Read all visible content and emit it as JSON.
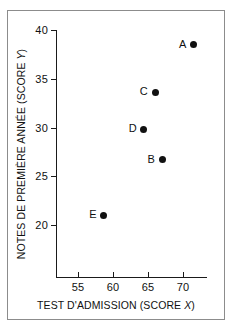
{
  "chart_data": {
    "type": "scatter",
    "title": "",
    "xlabel": "TEST D'ADMISSION (SCORE X)",
    "ylabel": "NOTES DE PREMIÈRE ANNÉE (SCORE Y)",
    "xlabel_prefix": "TEST D'ADMISSION (SCORE ",
    "xlabel_italic": "X",
    "xlabel_suffix": ")",
    "ylabel_prefix": "NOTES DE PREMIÈRE ANNÉE (SCORE ",
    "ylabel_italic": "Y",
    "ylabel_suffix": ")",
    "xlim": [
      52.5,
      74.0
    ],
    "ylim": [
      18.0,
      40.0
    ],
    "xticks": [
      55,
      60,
      65,
      70
    ],
    "yticks": [
      20,
      25,
      30,
      35,
      40
    ],
    "xtick_labels": [
      "55",
      "60",
      "65",
      "70"
    ],
    "ytick_labels": [
      "20",
      "25",
      "30",
      "35",
      "40"
    ],
    "grid": false,
    "legend": false,
    "marker": "filled-circle",
    "marker_color": "#111111",
    "points": [
      {
        "label": "A",
        "x": 71.5,
        "y": 38.5
      },
      {
        "label": "B",
        "x": 67.0,
        "y": 26.7
      },
      {
        "label": "C",
        "x": 66.0,
        "y": 33.6
      },
      {
        "label": "D",
        "x": 64.4,
        "y": 29.8
      },
      {
        "label": "E",
        "x": 58.7,
        "y": 21.0
      }
    ]
  },
  "figure": {
    "frame_color": "#8c8c8c",
    "background": "#ffffff",
    "axis_color": "#1a1a1a",
    "text_color": "#111111"
  }
}
